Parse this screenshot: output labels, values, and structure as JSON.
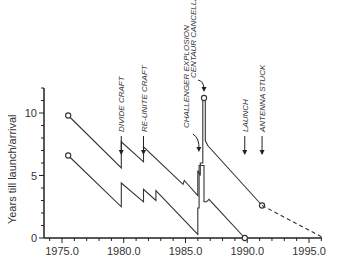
{
  "chart_data": {
    "type": "line",
    "title": "",
    "xlabel": "",
    "ylabel": "Years till launch/arrival",
    "xlim": [
      1973.5,
      1997.0
    ],
    "ylim": [
      0,
      13
    ],
    "x_ticks": [
      "1975.0",
      "1980.0",
      "1985.0",
      "1990.0",
      "1995.0"
    ],
    "y_ticks": [
      "0",
      "5",
      "10"
    ],
    "grid": false,
    "legend": null,
    "series": [
      {
        "name": "Years till arrival",
        "style": "solid",
        "points": [
          [
            1975.5,
            9.8
          ],
          [
            1979.8,
            5.6
          ],
          [
            1979.8,
            7.7
          ],
          [
            1981.6,
            6.1
          ],
          [
            1981.6,
            7.3
          ],
          [
            1984.8,
            4.3
          ],
          [
            1984.9,
            4.6
          ],
          [
            1986.0,
            3.4
          ],
          [
            1986.0,
            5.4
          ],
          [
            1986.2,
            5.0
          ],
          [
            1986.2,
            6.0
          ],
          [
            1986.4,
            6.0
          ],
          [
            1986.4,
            11.2
          ],
          [
            1986.6,
            11.2
          ],
          [
            1986.6,
            7.8
          ],
          [
            1986.8,
            7.4
          ],
          [
            1991.2,
            2.6
          ]
        ],
        "markers": [
          [
            1975.5,
            9.8
          ],
          [
            1986.5,
            11.2
          ],
          [
            1991.2,
            2.6
          ]
        ]
      },
      {
        "name": "Years till arrival (projected)",
        "style": "dashed",
        "points": [
          [
            1991.2,
            2.6
          ],
          [
            1996.2,
            0.0
          ]
        ]
      },
      {
        "name": "Years till launch",
        "style": "solid",
        "points": [
          [
            1975.5,
            6.6
          ],
          [
            1979.8,
            2.5
          ],
          [
            1979.8,
            4.4
          ],
          [
            1981.6,
            2.9
          ],
          [
            1981.6,
            3.9
          ],
          [
            1982.6,
            3.0
          ],
          [
            1982.6,
            3.8
          ],
          [
            1986.0,
            0.3
          ],
          [
            1986.0,
            2.4
          ],
          [
            1986.1,
            2.4
          ],
          [
            1986.1,
            5.8
          ],
          [
            1986.5,
            5.8
          ],
          [
            1986.5,
            2.9
          ],
          [
            1986.7,
            2.9
          ],
          [
            1986.9,
            3.1
          ],
          [
            1989.8,
            0.0
          ]
        ],
        "markers": [
          [
            1975.5,
            6.6
          ],
          [
            1989.8,
            0.0
          ]
        ]
      }
    ],
    "annotations": [
      {
        "label": "DIVIDE CRAFT",
        "x": 1979.8,
        "type": "arrow-down"
      },
      {
        "label": "RE-UNITE CRAFT",
        "x": 1981.6,
        "type": "arrow-down"
      },
      {
        "label": "CHALLENGER EXPLOSION",
        "x": 1986.0,
        "type": "curved-arrow"
      },
      {
        "label": "CENTAUR CANCELLATION",
        "x": 1986.5,
        "type": "curved-arrow"
      },
      {
        "label": "LAUNCH",
        "x": 1989.8,
        "type": "arrow-down"
      },
      {
        "label": "ANTENNA STUCK",
        "x": 1991.2,
        "type": "arrow-down"
      }
    ]
  }
}
